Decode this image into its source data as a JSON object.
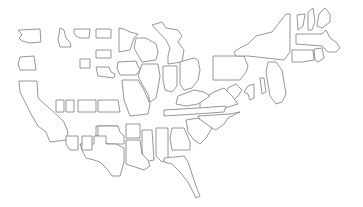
{
  "map": {
    "title": "",
    "region": "United States",
    "style": {
      "background": "#ffffff",
      "stroke": "#8a8a8a",
      "fill": "#ffffff"
    },
    "states": [
      {
        "id": "WA",
        "name": "Washington",
        "d": "M18,30 L40,29 L41,42 L30,43 L22,41 L19,38 L22,35 L20,32 Z"
      },
      {
        "id": "OR",
        "name": "Oregon",
        "d": "M20,57 L34,56 L36,70 L20,70 L18,64 Z"
      },
      {
        "id": "CA",
        "name": "California",
        "d": "M19,81 L37,81 L38,98 L58,116 L64,122 L68,132 L66,140 L50,142 L46,132 L38,126 L32,116 L28,108 L24,100 L20,92 Z"
      },
      {
        "id": "ID",
        "name": "Idaho",
        "d": "M60,28 L64,30 L66,38 L70,42 L71,47 L60,47 L58,40 Z"
      },
      {
        "id": "MT",
        "name": "Montana",
        "d": "M74,29 L90,29 L89,38 L80,38 L76,36 L74,33 Z"
      },
      {
        "id": "WY",
        "name": "Wyoming",
        "d": "M96,29 L111,29 L111,38 L96,38 Z"
      },
      {
        "id": "ND",
        "name": "North Dakota",
        "d": "M96,50 L111,50 L111,58 L96,58 Z"
      },
      {
        "id": "SD",
        "name": "South Dakota",
        "d": "M96,67 L109,67 L111,72 L115,74 L114,78 L98,76 Z"
      },
      {
        "id": "NE",
        "name": "Nebraska",
        "d": "M80,59 L90,59 L90,68 L80,68 Z"
      },
      {
        "id": "MN",
        "name": "Minnesota",
        "d": "M119,28 L124,29 L130,32 L138,34 L134,38 L132,44 L130,50 L119,52 Z"
      },
      {
        "id": "WI",
        "name": "Wisconsin",
        "d": "M136,38 L146,38 L156,44 L158,52 L156,60 L142,62 L138,55 L134,48 Z"
      },
      {
        "id": "IA",
        "name": "Iowa",
        "d": "M118,62 L136,61 L138,66 L140,70 L136,75 L120,75 L117,68 Z"
      },
      {
        "id": "MI",
        "name": "Michigan",
        "d": "M152,25 L162,22 L166,28 L178,30 L182,36 L178,42 L184,50 L182,62 L168,64 L168,56 L170,48 L166,40 Z"
      },
      {
        "id": "IL",
        "name": "Illinois",
        "d": "M142,64 L158,64 L160,76 L158,88 L156,98 L150,102 L148,94 L142,84 L138,76 Z"
      },
      {
        "id": "IN",
        "name": "Indiana",
        "d": "M163,66 L177,66 L177,86 L172,92 L165,90 L163,80 Z"
      },
      {
        "id": "OH",
        "name": "Ohio",
        "d": "M180,62 L194,58 L198,60 L200,70 L198,80 L192,88 L184,90 L180,84 Z"
      },
      {
        "id": "PA",
        "name": "Pennsylvania",
        "d": "M213,56 L244,56 L248,66 L246,72 L240,80 L213,80 Z"
      },
      {
        "id": "NY",
        "name": "New York",
        "d": "M234,52 L240,48 L248,44 L256,36 L272,32 L286,14 L290,14 L290,52 L284,60 L248,56 L236,56 Z"
      },
      {
        "id": "VT",
        "name": "Vermont",
        "d": "M297,15 L305,14 L303,26 L298,30 Z"
      },
      {
        "id": "NH",
        "name": "New Hampshire",
        "d": "M308,12 L313,8 L315,22 L312,30 L308,30 Z"
      },
      {
        "id": "ME",
        "name": "Maine",
        "d": "M319,14 L325,8 L330,14 L330,22 L322,28 L317,26 Z"
      },
      {
        "id": "MA",
        "name": "Massachusetts",
        "d": "M296,34 L322,34 L326,30 L330,38 L336,42 L340,48 L336,52 L328,52 L322,46 L296,44 Z"
      },
      {
        "id": "CT",
        "name": "Connecticut",
        "d": "M292,50 L313,50 L314,60 L302,62 L292,62 Z"
      },
      {
        "id": "RI",
        "name": "Rhode Island",
        "d": "M314,49 L322,48 L324,58 L318,62 L315,60 Z"
      },
      {
        "id": "NJ",
        "name": "New Jersey",
        "d": "M268,62 L276,62 L282,70 L284,82 L286,94 L282,102 L276,104 L270,96 L268,84 L266,72 Z"
      },
      {
        "id": "DE",
        "name": "Delaware",
        "d": "M260,78 L264,78 L266,92 L262,94 Z"
      },
      {
        "id": "MD",
        "name": "Maryland",
        "d": "M248,86 L254,84 L254,98 L250,100 L248,94 L244,92 Z"
      },
      {
        "id": "WV",
        "name": "West Virginia",
        "d": "M228,88 L236,84 L242,90 L238,96 L232,102 L224,98 Z"
      },
      {
        "id": "VA",
        "name": "Virginia",
        "d": "M200,100 L214,92 L224,88 L232,96 L238,104 L218,110 L200,112 Z"
      },
      {
        "id": "KY",
        "name": "Kentucky",
        "d": "M178,96 L194,90 L204,92 L210,96 L198,104 L186,106 L176,104 Z"
      },
      {
        "id": "TN",
        "name": "Tennessee",
        "d": "M164,110 L198,108 L226,106 L224,112 L196,114 L164,116 Z"
      },
      {
        "id": "NC",
        "name": "North Carolina",
        "d": "M198,116 L230,114 L240,112 L228,118 L224,124 L216,130 L208,126 L200,120 Z"
      },
      {
        "id": "SC",
        "name": "South Carolina",
        "d": "M186,120 L198,118 L212,128 L206,138 L200,144 L194,140 L188,132 Z"
      },
      {
        "id": "GA",
        "name": "Georgia",
        "d": "M172,128 L184,128 L190,142 L190,150 L172,150 L170,138 Z"
      },
      {
        "id": "AL",
        "name": "Alabama",
        "d": "M156,128 L168,128 L168,158 L162,162 L156,156 Z"
      },
      {
        "id": "MS",
        "name": "Mississippi",
        "d": "M142,130 L152,130 L154,160 L144,162 L142,150 Z"
      },
      {
        "id": "FL",
        "name": "Florida",
        "d": "M164,158 L184,156 L188,162 L192,174 L196,186 L200,196 L196,198 L192,190 L188,182 L180,172 L172,164 L164,162 Z"
      },
      {
        "id": "LA",
        "name": "Louisiana",
        "d": "M126,140 L140,140 L142,154 L148,160 L150,166 L144,170 L138,168 L126,164 Z"
      },
      {
        "id": "AR",
        "name": "Arkansas",
        "d": "M126,124 L140,124 L140,138 L126,138 Z"
      },
      {
        "id": "MO",
        "name": "Missouri",
        "d": "M122,80 L138,80 L144,90 L150,104 L148,114 L130,116 L124,100 Z"
      },
      {
        "id": "KS",
        "name": "Kansas",
        "d": "M96,126 L118,126 L118,136 L96,136 Z"
      },
      {
        "id": "OK",
        "name": "Oklahoma",
        "d": "M98,126 L118,126 L120,132 L124,136 L124,144 L110,144 L100,142 L98,136 Z"
      },
      {
        "id": "TX",
        "name": "Texas",
        "d": "M94,136 L106,136 L106,144 L116,144 L124,148 L124,162 L120,176 L112,176 L108,170 L100,162 L94,160 L86,158 L82,150 L80,144 L94,144 Z"
      },
      {
        "id": "NM",
        "name": "New Mexico",
        "d": "M82,136 L92,136 L92,150 L82,150 Z"
      },
      {
        "id": "AZ",
        "name": "Arizona",
        "d": "M66,136 L78,136 L78,150 L70,150 L66,144 Z"
      },
      {
        "id": "UT",
        "name": "Utah",
        "d": "M56,100 L64,100 L64,112 L56,112 Z"
      },
      {
        "id": "NV",
        "name": "Nevada",
        "d": "M66,100 L74,100 L74,112 L66,112 Z"
      },
      {
        "id": "CO",
        "name": "Colorado",
        "d": "M78,100 L96,100 L96,112 L78,112 Z"
      },
      {
        "id": "KS2",
        "name": "Kansas",
        "d": "M98,100 L118,100 L120,112 L98,112 Z"
      }
    ]
  }
}
